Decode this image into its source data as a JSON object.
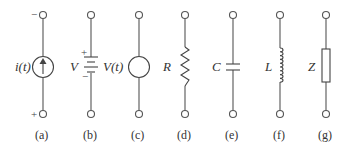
{
  "figure": {
    "components": [
      {
        "id": "a",
        "caption": "(a)",
        "label": "i(t)",
        "type": "current-source",
        "top_polarity": "−",
        "bottom_polarity": "+"
      },
      {
        "id": "b",
        "caption": "(b)",
        "label": "V",
        "type": "dc-voltage-source-battery",
        "plus": "+",
        "minus": "−"
      },
      {
        "id": "c",
        "caption": "(c)",
        "label": "V(t)",
        "type": "voltage-source"
      },
      {
        "id": "d",
        "caption": "(d)",
        "label": "R",
        "type": "resistor"
      },
      {
        "id": "e",
        "caption": "(e)",
        "label": "C",
        "type": "capacitor"
      },
      {
        "id": "f",
        "caption": "(f)",
        "label": "L",
        "type": "inductor"
      },
      {
        "id": "g",
        "caption": "(g)",
        "label": "Z",
        "type": "impedance"
      }
    ],
    "colors": {
      "line": "#555555",
      "text": "#333333",
      "background": "#ffffff"
    }
  }
}
